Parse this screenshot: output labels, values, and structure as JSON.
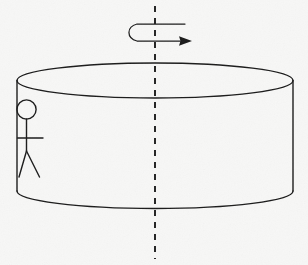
{
  "figure": {
    "kind": "physics-line-diagram",
    "background_color": "#f7f7f6",
    "ink_color": "#1a1a1a",
    "canvas": {
      "width": 308,
      "height": 265
    }
  },
  "cylinder": {
    "name": "rotating-platform",
    "center_x": 155,
    "top_ellipse": {
      "cx": 155,
      "cy": 80.5,
      "rx": 138,
      "ry": 17.5
    },
    "bottom_front_arc": {
      "cx": 155,
      "cy": 191,
      "rx": 138,
      "ry": 17.5
    },
    "left_wall_x": 17,
    "right_wall_x": 293,
    "wall_top_y": 80.5,
    "wall_bottom_y": 191,
    "stroke_width": 1.4
  },
  "rotation_axis": {
    "name": "axis-of-rotation",
    "style": "dashed-vertical",
    "x": 155,
    "y_start": 6,
    "y_end": 259,
    "dash_pattern": "6 6",
    "stroke_width": 1.9
  },
  "rotation_arrow": {
    "name": "rotation-direction-arrow",
    "style": "hooked-curved-arrow",
    "top_stroke": {
      "x1": 185,
      "y1": 24,
      "x2": 137,
      "y2": 24
    },
    "curve": {
      "cx": 126,
      "cy": 32.5,
      "rx": 12,
      "ry": 9
    },
    "bottom_stroke": {
      "x1": 137,
      "y1": 41,
      "x2": 182,
      "y2": 41
    },
    "arrow_tip": {
      "x": 192,
      "y": 41
    },
    "direction": "clockwise-viewed-from-above"
  },
  "person": {
    "name": "stick-figure-person",
    "head": {
      "cx": 26.5,
      "cy": 109.5,
      "r": 9.6
    },
    "body": {
      "x": 26.5,
      "y_top": 119,
      "y_bottom": 151
    },
    "arms": {
      "y": 138,
      "x_left": 17.5,
      "x_right": 43
    },
    "left_leg": {
      "x1": 26.5,
      "y1": 151,
      "x2": 19,
      "y2": 177
    },
    "right_leg": {
      "x1": 26.5,
      "y1": 151,
      "x2": 39.5,
      "y2": 177
    },
    "position_on_platform": "left-rim"
  },
  "labels": {
    "axis_label": "",
    "arrow_label": "",
    "person_label": "",
    "platform_label": ""
  }
}
